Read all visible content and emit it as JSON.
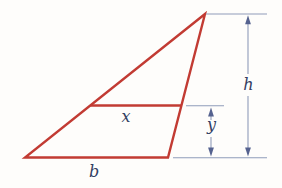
{
  "figure": {
    "labels": {
      "segment": "x",
      "base": "b",
      "height": "h",
      "offset": "y"
    },
    "colors": {
      "shape": "#c23b33",
      "extension_line": "#8f9cba",
      "arrow": "#55628f",
      "text": "#343f63",
      "background": "#fefdfb"
    }
  }
}
